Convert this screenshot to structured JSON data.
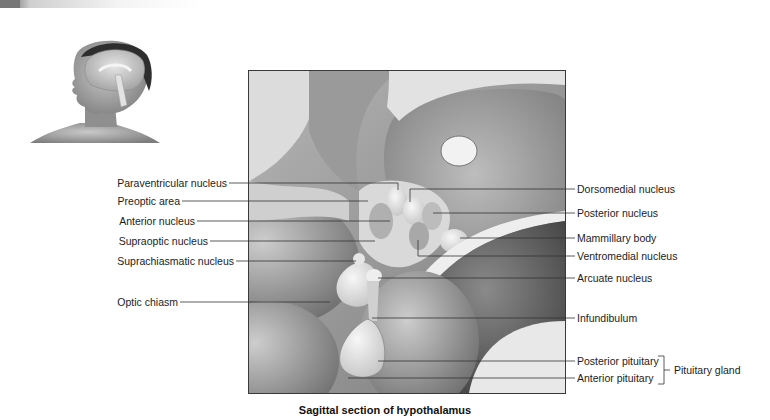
{
  "figure": {
    "caption": "Sagittal section of hypothalamus",
    "inset_image": "head-with-brain-sagittal-inset",
    "main_image": "hypothalamus-sagittal-illustration"
  },
  "labels_left": [
    {
      "id": "paraventricular",
      "text": "Paraventricular nucleus"
    },
    {
      "id": "preoptic",
      "text": "Preoptic area"
    },
    {
      "id": "anterior-nucleus",
      "text": "Anterior nucleus"
    },
    {
      "id": "supraoptic",
      "text": "Supraoptic nucleus"
    },
    {
      "id": "suprachiasmatic",
      "text": "Suprachiasmatic nucleus"
    },
    {
      "id": "optic-chiasm",
      "text": "Optic chiasm"
    }
  ],
  "labels_right": [
    {
      "id": "dorsomedial",
      "text": "Dorsomedial nucleus"
    },
    {
      "id": "posterior-nucleus",
      "text": "Posterior nucleus"
    },
    {
      "id": "mammillary",
      "text": "Mammillary body"
    },
    {
      "id": "ventromedial",
      "text": "Ventromedial nucleus"
    },
    {
      "id": "arcuate",
      "text": "Arcuate nucleus"
    },
    {
      "id": "infundibulum",
      "text": "Infundibulum"
    },
    {
      "id": "posterior-pituitary",
      "text": "Posterior pituitary"
    },
    {
      "id": "anterior-pituitary",
      "text": "Anterior pituitary"
    }
  ],
  "group_label": {
    "text": "Pituitary gland"
  }
}
